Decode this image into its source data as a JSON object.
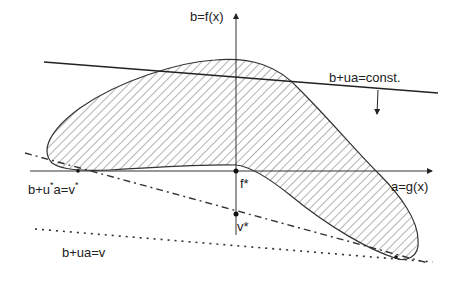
{
  "figure": {
    "axes": {
      "y_label": "b=f(x)",
      "x_label": "a=g(x)"
    },
    "lines": {
      "supporting_line": "b+ua=const.",
      "dual_optimal_line_prefix": "b+u",
      "dual_optimal_line_mid": "a=v",
      "dual_line": "b+ua=v"
    },
    "points": {
      "primal_optimum": "f*",
      "dual_optimum": "v*"
    },
    "star": "*",
    "colors": {
      "stroke": "#333333",
      "hatch": "#666666",
      "background": "#ffffff"
    }
  }
}
